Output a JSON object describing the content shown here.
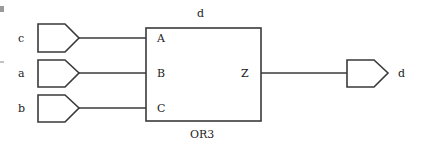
{
  "diagram": {
    "block": {
      "name": "OR3",
      "instance_label": "d",
      "input_pins": [
        "A",
        "B",
        "C"
      ],
      "output_pin": "Z"
    },
    "input_ports": [
      {
        "label": "c",
        "connects_to": "A"
      },
      {
        "label": "a",
        "connects_to": "B"
      },
      {
        "label": "b",
        "connects_to": "C"
      }
    ],
    "output_port": {
      "label": "d",
      "connects_from": "Z"
    }
  }
}
